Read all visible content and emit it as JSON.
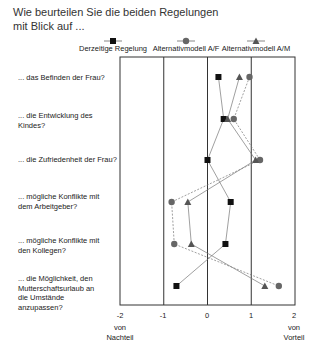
{
  "title_lines": [
    "Wie beurteilen Sie die beiden Regelungen",
    "mit Blick auf ..."
  ],
  "legend": [
    {
      "label": "Derzeitige Regelung",
      "marker": "square",
      "x": 113
    },
    {
      "label": "Alternativmodell A/F",
      "marker": "circle",
      "x": 186
    },
    {
      "label": "Alternativmodell A/M",
      "marker": "triangle",
      "x": 256
    }
  ],
  "row_labels": [
    "... das Befinden der Frau?",
    "... die Entwicklung des Kindes?",
    "... die Zufriedenheit der Frau?",
    "... mögliche Konflikte mit dem Arbeitgeber?",
    "... mögliche Konflikte mit den Kollegen?",
    "... die Möglichkeit, den Mutterschaftsurlaub an die Umstände anzupassen?"
  ],
  "axis": {
    "ticks": [
      "-2",
      "-1",
      "0",
      "1",
      "2"
    ],
    "left_label": "von Nachteil",
    "right_label": "von Vorteil"
  },
  "chart_data": {
    "type": "line",
    "orientation": "horizontal-profile",
    "title": "Wie beurteilen Sie die beiden Regelungen mit Blick auf ...",
    "categories": [
      "... das Befinden der Frau?",
      "... die Entwicklung des Kindes?",
      "... die Zufriedenheit der Frau?",
      "... mögliche Konflikte mit dem Arbeitgeber?",
      "... mögliche Konflikte mit den Kollegen?",
      "... die Möglichkeit, den Mutterschaftsurlaub an die Umstände anzupassen?"
    ],
    "series": [
      {
        "name": "Derzeitige Regelung",
        "marker": "square",
        "values": [
          0.25,
          0.37,
          0.0,
          0.53,
          0.41,
          -0.71
        ]
      },
      {
        "name": "Alternativmodell A/F",
        "marker": "circle",
        "values": [
          0.96,
          0.6,
          1.2,
          -0.82,
          -0.76,
          1.63
        ]
      },
      {
        "name": "Alternativmodell A/M",
        "marker": "triangle",
        "values": [
          0.73,
          0.46,
          1.1,
          -0.45,
          -0.37,
          1.31
        ]
      }
    ],
    "xlim": [
      -2,
      2
    ],
    "xticks": [
      -2,
      -1,
      0,
      1,
      2
    ],
    "xlabel_left": "von Nachteil",
    "xlabel_right": "von Vorteil",
    "grid": "vertical lines at -1, 0, 1",
    "legend_position": "top"
  }
}
